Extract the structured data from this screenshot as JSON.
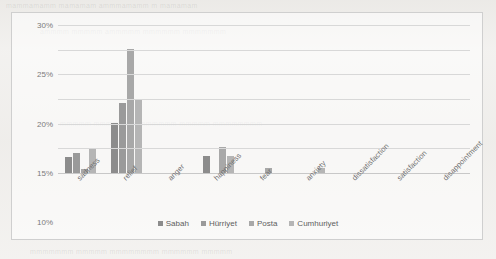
{
  "chart_data": {
    "type": "bar",
    "title": "",
    "subtitle": "",
    "xlabel": "",
    "ylabel": "",
    "grid": true,
    "legend_position": "bottom",
    "ylim": [
      0,
      30
    ],
    "ytick_labels": [
      "0%",
      "5%",
      "10%",
      "15%",
      "20%",
      "25%",
      "30%"
    ],
    "ytick_values": [
      0,
      5,
      10,
      15,
      20,
      25,
      30
    ],
    "categories": [
      "sadness",
      "relief",
      "anger",
      "happiness",
      "fear",
      "anxiety",
      "dissatisfaction",
      "satisfaction",
      "disappointment"
    ],
    "series": [
      {
        "name": "Sabah",
        "color": "#8c8c8c",
        "values": [
          3.2,
          10.1,
          0,
          3.4,
          0,
          0,
          0,
          0,
          0
        ]
      },
      {
        "name": "Hürriyet",
        "color": "#9a9a9a",
        "values": [
          4.1,
          14.1,
          0,
          0,
          0,
          0,
          0,
          0,
          0
        ]
      },
      {
        "name": "Posta",
        "color": "#a8a8a8",
        "values": [
          0.9,
          25.2,
          0,
          5.2,
          1.0,
          0,
          0,
          0,
          0
        ]
      },
      {
        "name": "Cumhuriyet",
        "color": "#b5b5b5",
        "values": [
          4.9,
          15.1,
          0,
          3.4,
          0,
          1.0,
          0,
          0,
          0
        ]
      }
    ]
  },
  "legend": {
    "items": [
      {
        "label": "Sabah"
      },
      {
        "label": "Hürriyet"
      },
      {
        "label": "Posta"
      },
      {
        "label": "Cumhuriyet"
      }
    ]
  },
  "background_text": {
    "lines": [
      "mammamamm mamamam ammmamamm m mamamam",
      "ammmm mmmmm ammmmm mmmmmm mmmmmmm",
      "mmmmm mmmmmm  mmmmmmm mmmmm mmmmmmmm",
      "mmmmmmm mmmmm mmmmmmmm mmmmmm mmmmm"
    ]
  }
}
